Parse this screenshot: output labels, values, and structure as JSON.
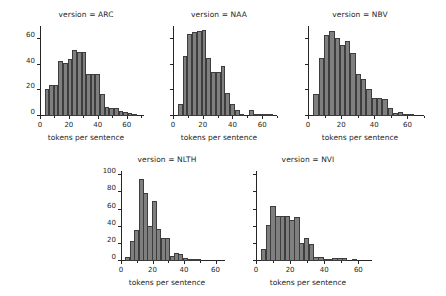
{
  "figure": {
    "background": "#ffffff",
    "bar_color": "#7f7f7f",
    "bar_edge_color": "#3d3d3d",
    "axis_color": "#262626",
    "xlabel": "tokens per sentence"
  },
  "chart_data": {
    "type": "bar",
    "title": "",
    "xlabel": "tokens per sentence",
    "ylabel": "",
    "grid": false,
    "legend": null,
    "facet_variable": "version",
    "bin_width": 3.2,
    "panels": [
      {
        "name": "ARC",
        "title": "version = ARC",
        "xlabel": "tokens per sentence",
        "xlim": [
          0,
          72
        ],
        "ylim": [
          0,
          70
        ],
        "xticks": [
          0,
          20,
          40,
          60
        ],
        "yticks": [
          0,
          20,
          40,
          60
        ],
        "ytick_labels": [
          "0",
          "20",
          "40",
          "60"
        ],
        "bin_starts": [
          3.2,
          6.4,
          9.6,
          12.8,
          16.0,
          19.2,
          22.4,
          25.6,
          28.8,
          32.0,
          35.2,
          38.4,
          41.6,
          44.8,
          48.0,
          51.2,
          54.4,
          57.6,
          60.8,
          64.0
        ],
        "values": [
          21,
          24,
          24,
          43,
          41,
          44,
          51,
          50,
          50,
          33,
          33,
          33,
          17,
          7,
          6,
          6,
          4,
          3,
          2,
          1
        ]
      },
      {
        "name": "NAA",
        "title": "version = NAA",
        "xlabel": "tokens per sentence",
        "xlim": [
          0,
          70
        ],
        "ylim": [
          0,
          70
        ],
        "xticks": [
          0,
          20,
          40,
          60
        ],
        "yticks": [
          0,
          20,
          40,
          60
        ],
        "ytick_labels": [],
        "bin_starts": [
          3.2,
          6.4,
          9.6,
          12.8,
          16.0,
          19.2,
          22.4,
          25.6,
          28.8,
          32.0,
          35.2,
          38.4,
          41.6,
          44.8,
          48.0,
          51.2,
          54.4,
          57.6,
          60.8,
          64.0
        ],
        "values": [
          9,
          47,
          64,
          65,
          66,
          67,
          45,
          34,
          34,
          39,
          18,
          9,
          5,
          1,
          0,
          5,
          1,
          1,
          1,
          1
        ]
      },
      {
        "name": "NBV",
        "title": "version = NBV",
        "xlabel": "tokens per sentence",
        "xlim": [
          0,
          70
        ],
        "ylim": [
          0,
          70
        ],
        "xticks": [
          0,
          20,
          40,
          60
        ],
        "yticks": [
          0,
          20,
          40,
          60
        ],
        "ytick_labels": [],
        "bin_starts": [
          3.2,
          6.4,
          9.6,
          12.8,
          16.0,
          19.2,
          22.4,
          25.6,
          28.8,
          32.0,
          35.2,
          38.4,
          41.6,
          44.8,
          48.0,
          51.2,
          54.4,
          57.6,
          60.8
        ],
        "values": [
          17,
          45,
          63,
          66,
          61,
          55,
          58,
          49,
          33,
          29,
          21,
          14,
          14,
          13,
          6,
          2,
          3,
          1,
          1
        ]
      },
      {
        "name": "NLTH",
        "title": "version = NLTH",
        "xlabel": "tokens per sentence",
        "xlim": [
          0,
          66
        ],
        "ylim": [
          0,
          105
        ],
        "xticks": [
          0,
          20,
          40,
          60
        ],
        "yticks": [
          0,
          20,
          40,
          60,
          80,
          100
        ],
        "ytick_labels": [
          "0",
          "20",
          "40",
          "60",
          "80",
          "100"
        ],
        "bin_starts": [
          2.8,
          5.6,
          8.4,
          11.2,
          14.0,
          16.8,
          19.6,
          22.4,
          25.2,
          28.0,
          30.8,
          33.6,
          36.4,
          39.2,
          42.0,
          44.8,
          47.6
        ],
        "values": [
          5,
          23,
          36,
          96,
          79,
          41,
          70,
          37,
          27,
          27,
          6,
          9,
          8,
          3,
          1,
          1,
          1
        ]
      },
      {
        "name": "NVI",
        "title": "version = NVI",
        "xlabel": "tokens per sentence",
        "xlim": [
          0,
          68
        ],
        "ylim": [
          0,
          105
        ],
        "xticks": [
          0,
          20,
          40,
          60
        ],
        "yticks": [
          0,
          20,
          40,
          60,
          80,
          100
        ],
        "ytick_labels": [],
        "bin_starts": [
          2.8,
          5.6,
          8.4,
          11.2,
          14.0,
          16.8,
          19.6,
          22.4,
          25.2,
          28.0,
          30.8,
          33.6,
          36.4,
          39.2,
          42.0,
          44.8,
          47.6,
          50.4,
          56.0
        ],
        "values": [
          14,
          42,
          64,
          53,
          53,
          52,
          48,
          51,
          21,
          27,
          20,
          5,
          5,
          2,
          2,
          4,
          4,
          3,
          1
        ]
      }
    ]
  }
}
